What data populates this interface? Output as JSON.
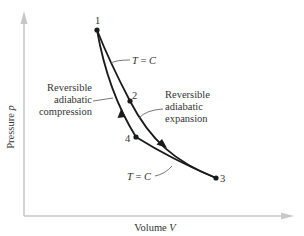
{
  "diagram": {
    "type": "P-V diagram (Carnot cycle)",
    "axes": {
      "y_label": "Pressure",
      "y_symbol": "p",
      "x_label": "Volume",
      "x_symbol": "V",
      "axis_color": "#c8c8c8"
    },
    "points": [
      {
        "id": "1",
        "label": "1"
      },
      {
        "id": "2",
        "label": "2"
      },
      {
        "id": "3",
        "label": "3"
      },
      {
        "id": "4",
        "label": "4"
      }
    ],
    "isotherm_label_upper": {
      "t": "T",
      "eq": " = ",
      "c": "C"
    },
    "isotherm_label_lower": {
      "t": "T",
      "eq": " = ",
      "c": "C"
    },
    "compression_label": [
      "Reversible",
      "adiabatic",
      "compression"
    ],
    "expansion_label": [
      "Reversible",
      "adiabatic",
      "expansion"
    ],
    "curve_color": "#1a1a1a",
    "text_color": "#333333"
  }
}
